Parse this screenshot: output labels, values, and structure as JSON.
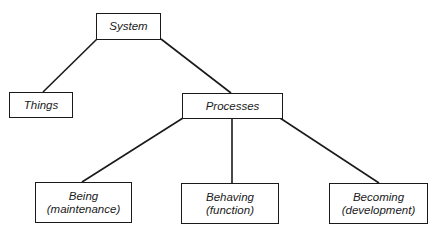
{
  "diagram": {
    "type": "tree",
    "line_color": "#1a1a1a",
    "nodes": {
      "system": {
        "label": "System"
      },
      "things": {
        "label": "Things"
      },
      "processes": {
        "label": "Processes"
      },
      "being": {
        "label": "Being",
        "sublabel": "(maintenance)"
      },
      "behaving": {
        "label": "Behaving",
        "sublabel": "(function)"
      },
      "becoming": {
        "label": "Becoming",
        "sublabel": "(development)"
      }
    },
    "edges": [
      {
        "from": "System",
        "to": "Things"
      },
      {
        "from": "System",
        "to": "Processes"
      },
      {
        "from": "Processes",
        "to": "Being"
      },
      {
        "from": "Processes",
        "to": "Behaving"
      },
      {
        "from": "Processes",
        "to": "Becoming"
      }
    ]
  }
}
